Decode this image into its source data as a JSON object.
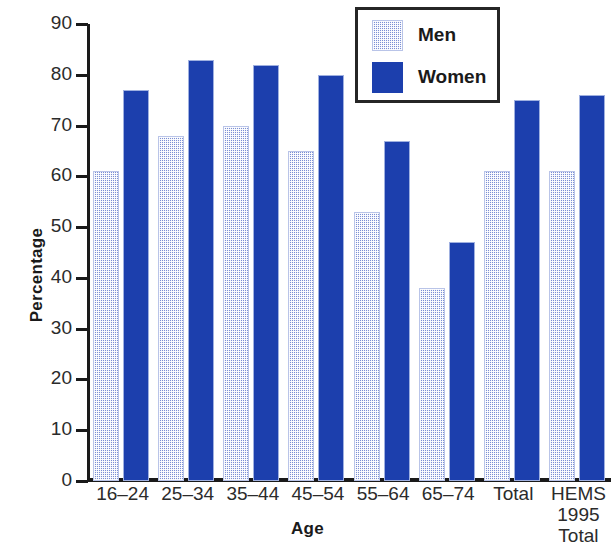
{
  "chart_data": {
    "type": "bar",
    "title": "",
    "xlabel": "Age",
    "ylabel": "Percentage",
    "ylim": [
      0,
      90
    ],
    "yticks": [
      0,
      10,
      20,
      30,
      40,
      50,
      60,
      70,
      80,
      90
    ],
    "grid": false,
    "legend_position": "top-right",
    "categories": [
      "16–24",
      "25–34",
      "35–44",
      "45–54",
      "55–64",
      "65–74",
      "Total",
      "HEMS\n1995\nTotal"
    ],
    "category_lines": [
      [
        "16–24"
      ],
      [
        "25–34"
      ],
      [
        "35–44"
      ],
      [
        "45–54"
      ],
      [
        "55–64"
      ],
      [
        "65–74"
      ],
      [
        "Total"
      ],
      [
        "HEMS",
        "1995",
        "Total"
      ]
    ],
    "series": [
      {
        "name": "Men",
        "color": "#7b8fd4",
        "pattern": "stipple",
        "values": [
          61,
          68,
          70,
          65,
          53,
          38,
          61,
          61
        ]
      },
      {
        "name": "Women",
        "color": "#1c3fad",
        "pattern": "solid",
        "values": [
          77,
          83,
          82,
          80,
          67,
          47,
          75,
          76
        ]
      }
    ]
  },
  "legend": {
    "items": [
      {
        "label": "Men",
        "swatch": "men-swatch"
      },
      {
        "label": "Women",
        "swatch": "women-swatch"
      }
    ]
  },
  "axes": {
    "y_title": "Percentage",
    "x_title": "Age",
    "y_tick_labels": [
      "90",
      "80",
      "70",
      "60",
      "50",
      "40",
      "30",
      "20",
      "10",
      "0"
    ]
  },
  "colors": {
    "men_fill": "#7b8fd4",
    "women_fill": "#1c3fad",
    "axis": "#1a1a1a",
    "background": "#ffffff",
    "legend_border": "#262626"
  }
}
